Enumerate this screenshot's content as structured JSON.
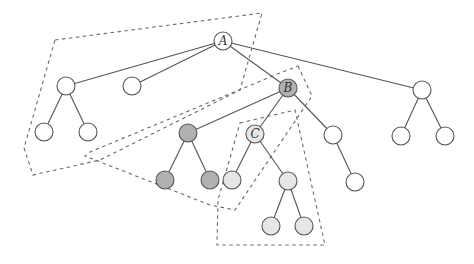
{
  "diagram": {
    "type": "tree",
    "colors": {
      "white": "#ffffff",
      "dark_gray": "#b0b0b0",
      "light_gray": "#e6e6e6",
      "edge": "#555555",
      "dashed": "#6a6a6a"
    },
    "nodes": [
      {
        "id": "A",
        "label": "A",
        "x": 223,
        "y": 41,
        "fill": "#ffffff",
        "bold": false
      },
      {
        "id": "L1",
        "label": "",
        "x": 66,
        "y": 86,
        "fill": "#ffffff",
        "bold": false
      },
      {
        "id": "L2",
        "label": "",
        "x": 132,
        "y": 86,
        "fill": "#ffffff",
        "bold": false
      },
      {
        "id": "B",
        "label": "B",
        "x": 288,
        "y": 88,
        "fill": "#b0b0b0",
        "bold": false
      },
      {
        "id": "R1",
        "label": "",
        "x": 422,
        "y": 90,
        "fill": "#ffffff",
        "bold": false
      },
      {
        "id": "L1a",
        "label": "",
        "x": 44,
        "y": 132,
        "fill": "#ffffff",
        "bold": false
      },
      {
        "id": "L1b",
        "label": "",
        "x": 88,
        "y": 132,
        "fill": "#ffffff",
        "bold": false
      },
      {
        "id": "G1",
        "label": "",
        "x": 188,
        "y": 133,
        "fill": "#b0b0b0",
        "bold": false
      },
      {
        "id": "C",
        "label": "C",
        "x": 255,
        "y": 134,
        "fill": "#e6e6e6",
        "bold": true
      },
      {
        "id": "B3",
        "label": "",
        "x": 333,
        "y": 135,
        "fill": "#ffffff",
        "bold": false
      },
      {
        "id": "R1a",
        "label": "",
        "x": 401,
        "y": 136,
        "fill": "#ffffff",
        "bold": false
      },
      {
        "id": "R1b",
        "label": "",
        "x": 445,
        "y": 136,
        "fill": "#ffffff",
        "bold": false
      },
      {
        "id": "G1a",
        "label": "",
        "x": 165,
        "y": 180,
        "fill": "#b0b0b0",
        "bold": false
      },
      {
        "id": "G1b",
        "label": "",
        "x": 210,
        "y": 180,
        "fill": "#b0b0b0",
        "bold": false
      },
      {
        "id": "Ca",
        "label": "",
        "x": 232,
        "y": 180,
        "fill": "#e6e6e6",
        "bold": false
      },
      {
        "id": "Cb",
        "label": "",
        "x": 288,
        "y": 181,
        "fill": "#e6e6e6",
        "bold": false
      },
      {
        "id": "B3a",
        "label": "",
        "x": 355,
        "y": 182,
        "fill": "#ffffff",
        "bold": false
      },
      {
        "id": "Cba",
        "label": "",
        "x": 271,
        "y": 226,
        "fill": "#e6e6e6",
        "bold": false
      },
      {
        "id": "Cbb",
        "label": "",
        "x": 304,
        "y": 226,
        "fill": "#e6e6e6",
        "bold": false
      }
    ],
    "edges": [
      [
        "A",
        "L1"
      ],
      [
        "A",
        "L2"
      ],
      [
        "A",
        "B"
      ],
      [
        "A",
        "R1"
      ],
      [
        "L1",
        "L1a"
      ],
      [
        "L1",
        "L1b"
      ],
      [
        "B",
        "G1"
      ],
      [
        "B",
        "C"
      ],
      [
        "B",
        "B3"
      ],
      [
        "R1",
        "R1a"
      ],
      [
        "R1",
        "R1b"
      ],
      [
        "G1",
        "G1a"
      ],
      [
        "G1",
        "G1b"
      ],
      [
        "C",
        "Ca"
      ],
      [
        "C",
        "Cb"
      ],
      [
        "B3",
        "B3a"
      ],
      [
        "Cb",
        "Cba"
      ],
      [
        "Cb",
        "Cbb"
      ]
    ],
    "regions": [
      {
        "name": "region-A",
        "points": "55,40 262,13 240,90 100,160 33,175 24,148"
      },
      {
        "name": "region-B",
        "points": "298,66 312,96 235,210 210,205 85,156 90,152 275,75"
      },
      {
        "name": "region-C",
        "points": "240,123 295,110 325,245 217,245 218,200"
      }
    ]
  }
}
